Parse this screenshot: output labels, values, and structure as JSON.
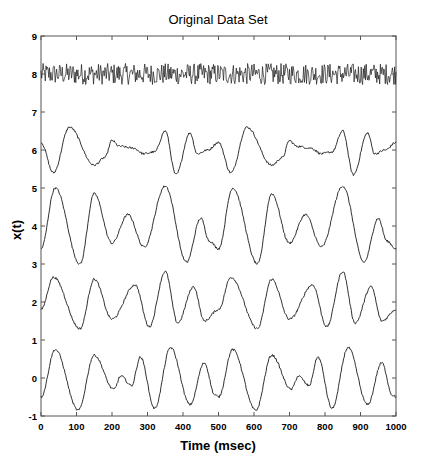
{
  "chart_data": {
    "type": "line",
    "title": "Original Data Set",
    "xlabel": "Time (msec)",
    "ylabel": "x(t)",
    "xlim": [
      0,
      1000
    ],
    "ylim": [
      -1,
      9
    ],
    "xticks": [
      0,
      100,
      200,
      300,
      400,
      500,
      600,
      700,
      800,
      900,
      1000
    ],
    "yticks": [
      -1,
      0,
      1,
      2,
      3,
      4,
      5,
      6,
      7,
      8,
      9
    ],
    "grid": false,
    "legend": null,
    "line_color": "#1a1a1a",
    "series": [
      {
        "name": "trace-1-noise",
        "kind": "noise",
        "center": 8.0,
        "amplitude": 0.28,
        "samples": 500
      },
      {
        "name": "trace-2",
        "period": 500,
        "x": [
          0,
          35,
          80,
          150,
          180,
          200,
          220,
          260,
          290,
          320,
          350,
          380,
          420,
          440,
          470,
          500
        ],
        "y": [
          6.2,
          5.4,
          6.6,
          5.6,
          5.8,
          6.25,
          6.1,
          6.05,
          5.9,
          5.95,
          6.5,
          5.35,
          6.45,
          5.9,
          6.0,
          6.2
        ]
      },
      {
        "name": "trace-3",
        "period": 500,
        "x": [
          0,
          40,
          110,
          150,
          200,
          245,
          290,
          350,
          410,
          450,
          475,
          500
        ],
        "y": [
          3.4,
          5.0,
          3.0,
          4.85,
          3.55,
          4.3,
          3.45,
          5.05,
          3.05,
          4.2,
          3.6,
          3.4
        ]
      },
      {
        "name": "trace-4",
        "period": 500,
        "x": [
          0,
          35,
          110,
          150,
          200,
          265,
          305,
          350,
          385,
          430,
          460,
          500
        ],
        "y": [
          1.8,
          2.65,
          1.3,
          2.6,
          1.55,
          2.45,
          1.35,
          2.8,
          1.45,
          2.4,
          1.5,
          1.8
        ]
      },
      {
        "name": "trace-5",
        "period": 500,
        "x": [
          0,
          40,
          105,
          150,
          205,
          225,
          255,
          280,
          320,
          365,
          420,
          460,
          490,
          500
        ],
        "y": [
          -0.5,
          0.75,
          -0.85,
          0.6,
          -0.3,
          0.05,
          -0.2,
          0.55,
          -0.8,
          0.8,
          -0.7,
          0.4,
          -0.45,
          -0.5
        ]
      }
    ]
  }
}
